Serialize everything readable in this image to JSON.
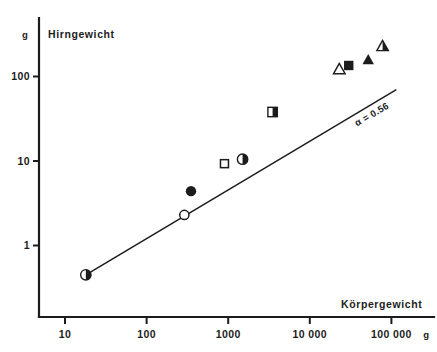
{
  "figure": {
    "y_axis_title": "Hirngewicht",
    "y_axis_unit": "g",
    "x_axis_title": "Körpergewicht",
    "x_axis_unit": "g",
    "annotation": "α = 0.56"
  },
  "chart_data": {
    "type": "scatter",
    "title": "",
    "xlabel": "Körpergewicht",
    "ylabel": "Hirngewicht",
    "xunit": "g",
    "yunit": "g",
    "xscale": "log",
    "yscale": "log",
    "xlim": [
      8,
      200000
    ],
    "ylim": [
      0.3,
      400
    ],
    "grid": false,
    "legend": "none",
    "xticks": [
      10,
      100,
      1000,
      10000,
      100000
    ],
    "xtick_labels": [
      "10",
      "100",
      "1000",
      "10 000",
      "100 000"
    ],
    "yticks": [
      1,
      10,
      100
    ],
    "ytick_labels": [
      "1",
      "10",
      "100"
    ],
    "annotations": [
      {
        "text": "α = 0.56",
        "x": 60000,
        "y": 33,
        "rotation": -30
      }
    ],
    "fit_line": {
      "label": "α = 0.56",
      "slope_alpha": 0.56,
      "x": [
        18,
        115000
      ],
      "y": [
        0.45,
        70
      ]
    },
    "points": [
      {
        "x": 18,
        "y": 0.45,
        "marker": "circle",
        "fill": "half"
      },
      {
        "x": 290,
        "y": 2.3,
        "marker": "circle",
        "fill": "open"
      },
      {
        "x": 350,
        "y": 4.4,
        "marker": "circle",
        "fill": "solid"
      },
      {
        "x": 900,
        "y": 9.3,
        "marker": "square",
        "fill": "open"
      },
      {
        "x": 1500,
        "y": 10.5,
        "marker": "circle",
        "fill": "half"
      },
      {
        "x": 3500,
        "y": 38,
        "marker": "square",
        "fill": "half"
      },
      {
        "x": 23000,
        "y": 120,
        "marker": "triangle",
        "fill": "open"
      },
      {
        "x": 30000,
        "y": 135,
        "marker": "square",
        "fill": "solid"
      },
      {
        "x": 52000,
        "y": 155,
        "marker": "triangle",
        "fill": "solid"
      },
      {
        "x": 78000,
        "y": 225,
        "marker": "triangle",
        "fill": "half"
      }
    ]
  }
}
